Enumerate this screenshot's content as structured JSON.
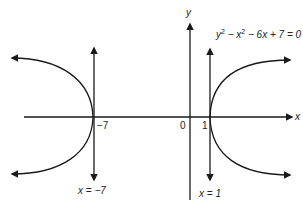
{
  "diagram": {
    "equation": "y² − x² − 6x + 7 = 0",
    "equation_parts": {
      "y": "y",
      "sup1": "2",
      "mid": " − x",
      "sup2": "2",
      "rest": " − 6x + 7 = 0"
    },
    "axis_x_label": "x",
    "axis_y_label": "y",
    "origin_label": "0",
    "tick_labels": {
      "neg7": "−7",
      "pos1": "1"
    },
    "asymptote_left_label": "x = −7",
    "asymptote_right_label": "x = 1",
    "colors": {
      "stroke": "#1a1a1a",
      "background": "#ffffff"
    }
  }
}
